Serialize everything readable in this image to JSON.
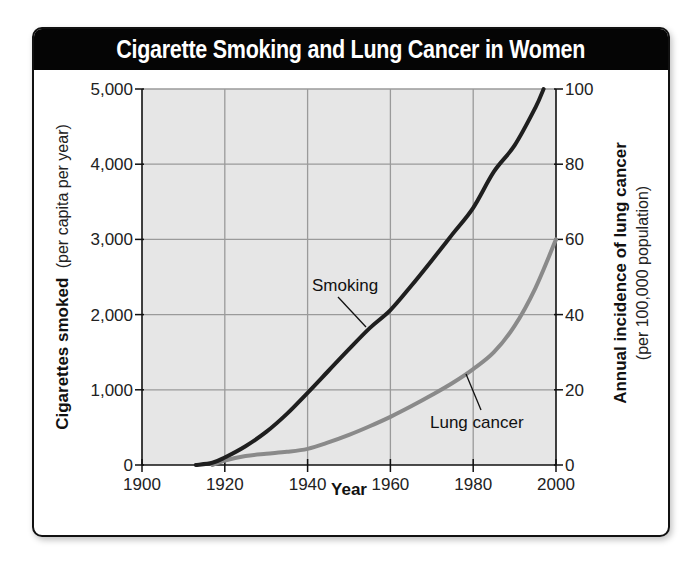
{
  "chart_data": {
    "type": "line",
    "title": "Cigarette Smoking and Lung Cancer in Women",
    "xlabel": "Year",
    "ylabel_left": {
      "main": "Cigarettes smoked",
      "sub": "(per capita per year)"
    },
    "ylabel_right": {
      "main": "Annual incidence of lung cancer",
      "sub": "(per 100,000 population)"
    },
    "x_ticks": [
      "1900",
      "1920",
      "1940",
      "1960",
      "1980",
      "2000"
    ],
    "y_left_ticks": [
      "0",
      "1,000",
      "2,000",
      "3,000",
      "4,000",
      "5,000"
    ],
    "y_right_ticks": [
      "0",
      "20",
      "40",
      "60",
      "80",
      "100"
    ],
    "xlim": [
      1900,
      2000
    ],
    "ylim_left": [
      0,
      5000
    ],
    "ylim_right": [
      0,
      100
    ],
    "grid": true,
    "series": [
      {
        "name": "Smoking",
        "axis": "left",
        "color": "#1f1f1f",
        "x": [
          1913,
          1917,
          1920,
          1925,
          1930,
          1935,
          1940,
          1945,
          1950,
          1955,
          1960,
          1965,
          1970,
          1975,
          1980,
          1985,
          1990,
          1995,
          1997
        ],
        "values": [
          0,
          30,
          100,
          250,
          440,
          680,
          960,
          1250,
          1540,
          1820,
          2060,
          2380,
          2720,
          3070,
          3420,
          3900,
          4250,
          4750,
          5000
        ]
      },
      {
        "name": "Lung cancer",
        "axis": "right",
        "color": "#8a8a8a",
        "x": [
          1917,
          1920,
          1925,
          1930,
          1935,
          1940,
          1945,
          1950,
          1955,
          1960,
          1965,
          1970,
          1975,
          1980,
          1985,
          1990,
          1995,
          2000
        ],
        "values": [
          0,
          1.2,
          2.4,
          3,
          3.5,
          4.3,
          6,
          8,
          10.3,
          12.8,
          15.6,
          18.6,
          21.8,
          25.5,
          30,
          37,
          47,
          60
        ]
      }
    ],
    "annotations": [
      {
        "text": "Smoking",
        "points_to": "Smoking"
      },
      {
        "text": "Lung cancer",
        "points_to": "Lung cancer"
      }
    ]
  },
  "labels": {
    "title": "Cigarette Smoking and Lung Cancer in Women",
    "xlabel": "Year",
    "yleft_main": "Cigarettes smoked",
    "yleft_sub": "(per capita per year)",
    "yright_main": "Annual incidence of lung cancer",
    "yright_sub": "(per 100,000 population)",
    "anno_smoking": "Smoking",
    "anno_lung": "Lung cancer",
    "x_ticks": [
      "1900",
      "1920",
      "1940",
      "1960",
      "1980",
      "2000"
    ],
    "y_left_ticks": [
      "0",
      "1,000",
      "2,000",
      "3,000",
      "4,000",
      "5,000"
    ],
    "y_right_ticks": [
      "0",
      "20",
      "40",
      "60",
      "80",
      "100"
    ]
  },
  "colors": {
    "plot_bg": "#e6e6e6",
    "grid": "#9a9a9a",
    "title_bg": "#050505",
    "title_fg": "#ffffff",
    "smoking": "#1f1f1f",
    "lung": "#8a8a8a"
  }
}
